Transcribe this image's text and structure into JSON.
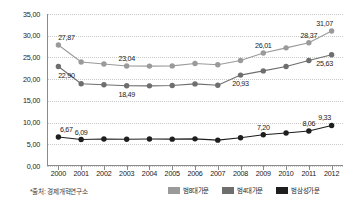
{
  "chart_data": {
    "type": "line",
    "title": "",
    "xlabel": "",
    "ylabel": "",
    "ylim": [
      0,
      35
    ],
    "ytick_step": 5,
    "grid": true,
    "legend_position": "bottom-right",
    "x": [
      2000,
      2001,
      2002,
      2003,
      2004,
      2005,
      2006,
      2007,
      2008,
      2009,
      2010,
      2011,
      2012
    ],
    "categories": [
      "2000",
      "2001",
      "2002",
      "2003",
      "2004",
      "2005",
      "2006",
      "2007",
      "2008",
      "2009",
      "2010",
      "2011",
      "2012"
    ],
    "ytick_labels": [
      "0,00",
      "5,00",
      "10,00",
      "15,00",
      "20,00",
      "25,00",
      "30,00",
      "35,00"
    ],
    "ytick_values": [
      0,
      5,
      10,
      15,
      20,
      25,
      30,
      35
    ],
    "series": [
      {
        "name": "범8대가문",
        "color": "#9a9a9a",
        "values": [
          27.87,
          23.95,
          23.5,
          23.04,
          23.0,
          23.05,
          23.6,
          23.3,
          24.3,
          26.01,
          27.2,
          28.37,
          31.07
        ],
        "labels": [
          {
            "x": 2000,
            "text": "27,87",
            "pos": "above"
          },
          {
            "x": 2003,
            "text": "23,04",
            "pos": "above"
          },
          {
            "x": 2009,
            "text": "26,01",
            "pos": "above"
          },
          {
            "x": 2011,
            "text": "28,37",
            "pos": "above"
          },
          {
            "x": 2012,
            "text": "31,07",
            "pos": "above"
          }
        ]
      },
      {
        "name": "범4대가문",
        "color": "#6e6e6e",
        "values": [
          22.9,
          18.95,
          18.7,
          18.49,
          18.45,
          18.55,
          18.9,
          18.6,
          20.93,
          21.9,
          22.9,
          24.3,
          25.63
        ],
        "labels": [
          {
            "x": 2000,
            "text": "22,90",
            "pos": "below"
          },
          {
            "x": 2003,
            "text": "18,49",
            "pos": "below"
          },
          {
            "x": 2008,
            "text": "20,93",
            "pos": "below"
          },
          {
            "x": 2012,
            "text": "25,63",
            "pos": "below"
          }
        ]
      },
      {
        "name": "범삼성가문",
        "color": "#1e1e1e",
        "values": [
          6.67,
          6.09,
          6.2,
          6.15,
          6.2,
          6.18,
          6.25,
          5.95,
          6.5,
          7.2,
          7.6,
          8.06,
          9.33
        ],
        "labels": [
          {
            "x": 2000,
            "text": "6,67",
            "pos": "above"
          },
          {
            "x": 2001,
            "text": "6,09",
            "pos": "above"
          },
          {
            "x": 2009,
            "text": "7,20",
            "pos": "above"
          },
          {
            "x": 2011,
            "text": "8,06",
            "pos": "above"
          },
          {
            "x": 2012,
            "text": "9,33",
            "pos": "above"
          }
        ]
      }
    ]
  },
  "footer": {
    "source_note": "*출처: 경제개혁연구소"
  }
}
